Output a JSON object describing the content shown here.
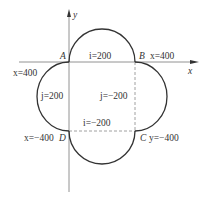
{
  "diagram": {
    "type": "tool-path-circular-arcs",
    "axes": {
      "x_label": "x",
      "y_label": "y"
    },
    "points": {
      "A": "A",
      "B": "B",
      "C": "C",
      "D": "D"
    },
    "labels": {
      "top_arc_i": "i=200",
      "B_x": "x=400",
      "left_x": "x=400",
      "left_arc_j": "j=200",
      "right_arc_j": "j=−200",
      "bottom_arc_i": "i=−200",
      "D_x": "x=−400",
      "C_y": "y=−400"
    },
    "colors": {
      "curve": "#333333",
      "axis": "#777777",
      "dashed": "#888888",
      "text": "#333333"
    }
  }
}
